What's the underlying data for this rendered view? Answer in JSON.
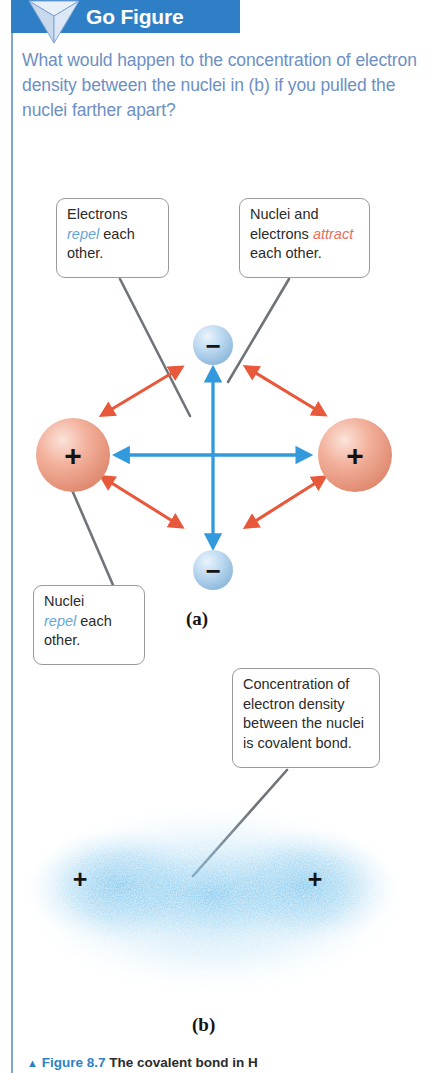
{
  "header": {
    "title": "Go Figure",
    "bar_color": "#2f7fc6",
    "icon": "inverted-triangle-icon"
  },
  "prompt": {
    "text": "What would happen to the concentration of electron density between the nuclei in (b) if you pulled the nuclei farther apart?",
    "color": "#6d8fc4"
  },
  "callouts": {
    "electrons_repel": {
      "line1": "Electrons",
      "emphasis": "repel",
      "line2_rest": " each",
      "line3": "other.",
      "emphasis_color": "#63a6d8"
    },
    "nuclei_electrons_attract": {
      "line1": "Nuclei and",
      "line2_prefix": "electrons ",
      "emphasis": "attract",
      "line3": "each other.",
      "emphasis_color": "#e8705a"
    },
    "nuclei_repel": {
      "line1": "Nuclei",
      "emphasis": "repel",
      "line2_rest": " each",
      "line3": "other.",
      "emphasis_color": "#63a6d8"
    },
    "covalent": {
      "line1": "Concentration of",
      "line2": "electron density",
      "line3": "between the nuclei",
      "line4": "is covalent bond."
    }
  },
  "diagram_a": {
    "nucleus_left_charge": "+",
    "nucleus_right_charge": "+",
    "electron_top_charge": "−",
    "electron_bottom_charge": "−",
    "nucleus_color": "#ef9b85",
    "electron_color": "#aaccea",
    "attraction_arrow_color": "#e8583a",
    "repulsion_arrow_color": "#3399dd",
    "panel_label": "(a)"
  },
  "diagram_b": {
    "nucleus_left_charge": "+",
    "nucleus_right_charge": "+",
    "cloud_color": "#63b8e8",
    "panel_label": "(b)"
  },
  "caption": {
    "marker": "▲",
    "figure_number": "Figure 8.7",
    "text": "The covalent bond in H"
  }
}
